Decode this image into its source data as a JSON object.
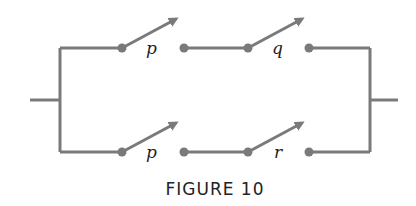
{
  "figure": {
    "caption": "FIGURE 10",
    "colors": {
      "wire": "#7a7a7a",
      "text": "#222222"
    }
  },
  "branches": [
    {
      "name": "top",
      "switches": [
        {
          "label": "p"
        },
        {
          "label": "q"
        }
      ]
    },
    {
      "name": "bottom",
      "switches": [
        {
          "label": "p"
        },
        {
          "label": "r"
        }
      ]
    }
  ]
}
